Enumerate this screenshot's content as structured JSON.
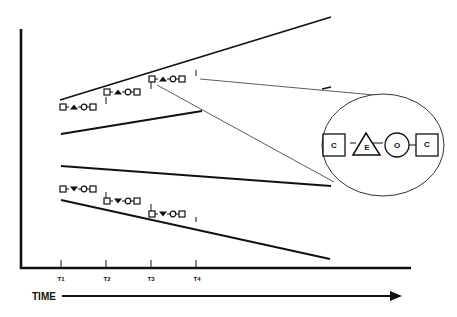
{
  "diagram": {
    "axis": {
      "time_label": "TIME",
      "ticks": [
        {
          "label": "T1",
          "x": 61
        },
        {
          "label": "T2",
          "x": 106
        },
        {
          "label": "T3",
          "x": 151
        },
        {
          "label": "T4",
          "x": 196
        }
      ]
    },
    "upper_funnel": {
      "description": "Diverging lines with upward-stepping chains",
      "chains": [
        {
          "start_tick": "T1",
          "symbols": [
            "square",
            "triangle-up",
            "circle",
            "square"
          ]
        },
        {
          "start_tick": "T2",
          "symbols": [
            "square",
            "triangle-up",
            "circle",
            "square"
          ]
        },
        {
          "start_tick": "T3",
          "symbols": [
            "square",
            "triangle-up",
            "circle",
            "square"
          ]
        }
      ]
    },
    "lower_funnel": {
      "description": "Diverging lines with downward-stepping chains",
      "chains": [
        {
          "start_tick": "T1",
          "symbols": [
            "square",
            "triangle-down",
            "circle",
            "square"
          ]
        },
        {
          "start_tick": "T2",
          "symbols": [
            "square",
            "triangle-down",
            "circle",
            "square"
          ]
        },
        {
          "start_tick": "T3",
          "symbols": [
            "square",
            "triangle-down",
            "circle",
            "square"
          ]
        }
      ]
    },
    "callout": {
      "shape": "circle-magnifier",
      "symbols": [
        {
          "shape": "square",
          "letter": "C"
        },
        {
          "shape": "triangle",
          "letter": "E"
        },
        {
          "shape": "circle",
          "letter": "O"
        },
        {
          "shape": "square",
          "letter": "C"
        }
      ]
    }
  }
}
